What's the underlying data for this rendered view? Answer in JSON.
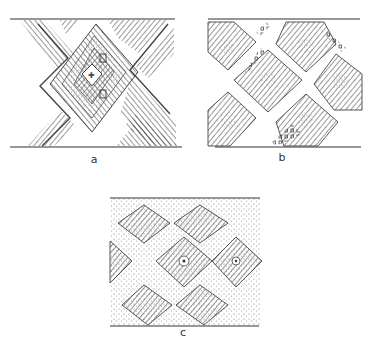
{
  "figure": {
    "panels": [
      {
        "id": "a",
        "label": "a",
        "motif": "interlaced X band with nested lozenge, hatched fill"
      },
      {
        "id": "b",
        "label": "b",
        "motif": "diagonal lattice of hatched lozenges with dotted centers"
      },
      {
        "id": "c",
        "label": "c",
        "motif": "hatched lozenges on stippled ground with central dot"
      }
    ],
    "colors": {
      "ink": "#3a3a3a",
      "paper": "#ffffff"
    }
  }
}
